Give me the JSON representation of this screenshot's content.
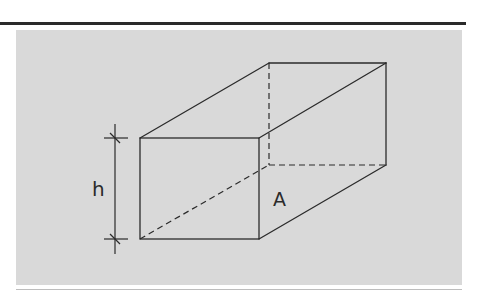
{
  "figure": {
    "type": "isometric-sketch-rectangular-prism",
    "labels": {
      "height": "h",
      "face": "A"
    },
    "colors": {
      "panel_background": "#d9d9d9",
      "stroke": "#2b2b2b",
      "page_background": "#ffffff"
    }
  }
}
